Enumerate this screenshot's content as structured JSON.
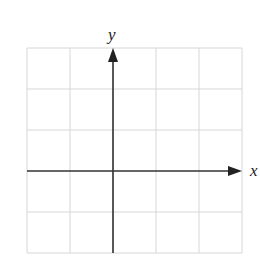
{
  "diagram": {
    "type": "coordinate-grid",
    "x_axis_label": "x",
    "y_axis_label": "y",
    "grid": {
      "columns": 5,
      "rows": 5
    },
    "colors": {
      "grid": "#d6d6d6",
      "axis": "#333333",
      "label": "#222222"
    }
  }
}
